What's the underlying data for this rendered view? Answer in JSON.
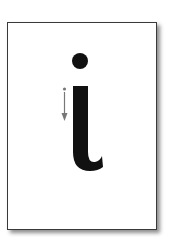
{
  "card": {
    "letter": "i",
    "description": "Lowercase letter i formation card with stroke direction arrow",
    "stroke_arrow": {
      "direction": "down",
      "color": "#777777"
    },
    "colors": {
      "letter": "#111111",
      "border": "#3a3a3a",
      "background": "#ffffff"
    }
  }
}
